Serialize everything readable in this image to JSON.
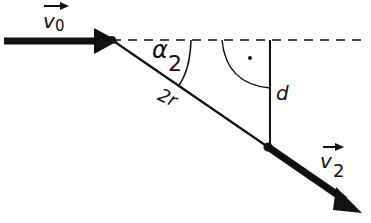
{
  "diagram": {
    "labels": {
      "v0": "v",
      "v0_sub": "0",
      "v2": "v",
      "v2_sub": "2",
      "alpha": "α",
      "alpha_sub": "2",
      "two_r": "2r",
      "d": "d"
    },
    "colors": {
      "stroke": "#111111",
      "background": "#ffffff"
    }
  }
}
